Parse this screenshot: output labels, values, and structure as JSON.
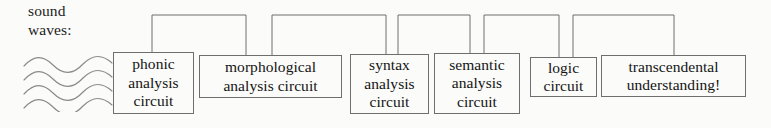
{
  "diagram": {
    "background_color": "#fbfbf9",
    "line_color": "#6e6e6e",
    "text_color": "#141414",
    "source_label": {
      "name": "sound-waves-label",
      "text": "sound\nwaves:"
    },
    "wave_glyph": {
      "name": "sound-wave-lines",
      "count": 4
    },
    "boxes": [
      {
        "id": "phonic-analysis-circuit",
        "label": "phonic\nanalysis\ncircuit",
        "x": 113,
        "y": 52,
        "w": 81,
        "h": 62
      },
      {
        "id": "morphological-analysis-circuit",
        "label": "morphological\nanalysis circuit",
        "x": 199,
        "y": 55,
        "w": 143,
        "h": 43
      },
      {
        "id": "syntax-analysis-circuit",
        "label": "syntax\nanalysis\ncircuit",
        "x": 350,
        "y": 54,
        "w": 79,
        "h": 60
      },
      {
        "id": "semantic-analysis-circuit",
        "label": "semantic\nanalysis\ncircuit",
        "x": 434,
        "y": 53,
        "w": 86,
        "h": 61
      },
      {
        "id": "logic-circuit",
        "label": "logic\ncircuit",
        "x": 530,
        "y": 57,
        "w": 67,
        "h": 40
      },
      {
        "id": "transcendental-understanding",
        "label": "transcendental\nunderstanding!",
        "x": 601,
        "y": 55,
        "w": 145,
        "h": 42
      }
    ],
    "connectors": [
      {
        "id": "connector-phonic-to-morphological",
        "from": "phonic-analysis-circuit",
        "to": "morphological-analysis-circuit",
        "x1": 152,
        "x2": 246,
        "top": 15
      },
      {
        "id": "connector-morphological-to-syntax",
        "from": "morphological-analysis-circuit",
        "to": "syntax-analysis-circuit",
        "x1": 272,
        "x2": 386,
        "top": 15
      },
      {
        "id": "connector-syntax-to-semantic",
        "from": "syntax-analysis-circuit",
        "to": "semantic-analysis-circuit",
        "x1": 398,
        "x2": 470,
        "top": 15
      },
      {
        "id": "connector-semantic-to-logic",
        "from": "semantic-analysis-circuit",
        "to": "logic-circuit",
        "x1": 484,
        "x2": 559,
        "top": 15
      },
      {
        "id": "connector-logic-to-transcendental",
        "from": "logic-circuit",
        "to": "transcendental-understanding",
        "x1": 573,
        "x2": 674,
        "top": 15
      }
    ]
  }
}
